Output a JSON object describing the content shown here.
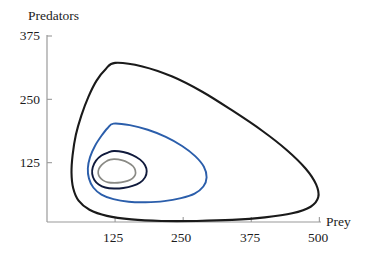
{
  "figure": {
    "name": "predator-prey-phase-portrait",
    "background_color": "#ffffff"
  },
  "chart_data": {
    "type": "line",
    "title": "",
    "subtitle": "",
    "xlabel": "Prey",
    "ylabel": "Predators",
    "xlim": [
      0,
      500
    ],
    "ylim": [
      0,
      375
    ],
    "xticks": [
      125,
      250,
      375,
      500
    ],
    "yticks": [
      125,
      250,
      375
    ],
    "xtick_labels": [
      "125",
      "250",
      "375",
      "500"
    ],
    "ytick_labels": [
      "125",
      "250",
      "375"
    ],
    "grid": false,
    "legend": null,
    "annotations": [],
    "axis_color": "#9a9a9a",
    "series": [
      {
        "name": "outer-orbit",
        "color": "#1a1a1a",
        "line_width": 2.1,
        "closed": true,
        "points": [
          [
            125,
            322
          ],
          [
            175,
            315
          ],
          [
            230,
            295
          ],
          [
            285,
            265
          ],
          [
            340,
            228
          ],
          [
            395,
            188
          ],
          [
            440,
            150
          ],
          [
            475,
            113
          ],
          [
            494,
            82
          ],
          [
            498,
            57
          ],
          [
            484,
            38
          ],
          [
            450,
            25
          ],
          [
            400,
            17
          ],
          [
            340,
            12
          ],
          [
            275,
            10
          ],
          [
            210,
            10
          ],
          [
            155,
            13
          ],
          [
            110,
            20
          ],
          [
            78,
            32
          ],
          [
            58,
            50
          ],
          [
            48,
            75
          ],
          [
            45,
            105
          ],
          [
            47,
            140
          ],
          [
            53,
            180
          ],
          [
            63,
            218
          ],
          [
            76,
            255
          ],
          [
            91,
            287
          ],
          [
            108,
            310
          ],
          [
            125,
            322
          ]
        ]
      },
      {
        "name": "second-orbit",
        "color": "#2b5eab",
        "line_width": 1.9,
        "closed": true,
        "points": [
          [
            122,
            202
          ],
          [
            152,
            199
          ],
          [
            185,
            190
          ],
          [
            218,
            176
          ],
          [
            248,
            158
          ],
          [
            272,
            138
          ],
          [
            288,
            117
          ],
          [
            293,
            96
          ],
          [
            287,
            78
          ],
          [
            271,
            64
          ],
          [
            246,
            55
          ],
          [
            215,
            49
          ],
          [
            181,
            47
          ],
          [
            150,
            48
          ],
          [
            122,
            53
          ],
          [
            100,
            62
          ],
          [
            85,
            76
          ],
          [
            77,
            94
          ],
          [
            75,
            114
          ],
          [
            79,
            136
          ],
          [
            88,
            158
          ],
          [
            100,
            178
          ],
          [
            111,
            193
          ],
          [
            122,
            202
          ]
        ]
      },
      {
        "name": "third-orbit",
        "color": "#101a3c",
        "line_width": 1.9,
        "closed": true,
        "points": [
          [
            123,
            148
          ],
          [
            140,
            146
          ],
          [
            157,
            140
          ],
          [
            171,
            131
          ],
          [
            180,
            120
          ],
          [
            183,
            108
          ],
          [
            180,
            96
          ],
          [
            171,
            86
          ],
          [
            157,
            79
          ],
          [
            140,
            75
          ],
          [
            123,
            74
          ],
          [
            107,
            76
          ],
          [
            95,
            82
          ],
          [
            87,
            91
          ],
          [
            83,
            103
          ],
          [
            84,
            116
          ],
          [
            90,
            129
          ],
          [
            100,
            139
          ],
          [
            112,
            145
          ],
          [
            123,
            148
          ]
        ]
      },
      {
        "name": "inner-orbit",
        "color": "#8a8a85",
        "line_width": 1.7,
        "closed": true,
        "points": [
          [
            124,
            132
          ],
          [
            137,
            130
          ],
          [
            149,
            125
          ],
          [
            158,
            118
          ],
          [
            162,
            110
          ],
          [
            162,
            101
          ],
          [
            157,
            94
          ],
          [
            148,
            89
          ],
          [
            136,
            86
          ],
          [
            124,
            85
          ],
          [
            112,
            86
          ],
          [
            103,
            90
          ],
          [
            97,
            96
          ],
          [
            94,
            104
          ],
          [
            95,
            112
          ],
          [
            100,
            120
          ],
          [
            108,
            127
          ],
          [
            116,
            131
          ],
          [
            124,
            132
          ]
        ]
      }
    ]
  },
  "axes": {
    "y_axis_title": "Predators",
    "x_axis_title": "Prey",
    "y_tick_375": "375",
    "y_tick_250": "250",
    "y_tick_125": "125",
    "x_tick_125": "125",
    "x_tick_250": "250",
    "x_tick_375": "375",
    "x_tick_500": "500"
  }
}
